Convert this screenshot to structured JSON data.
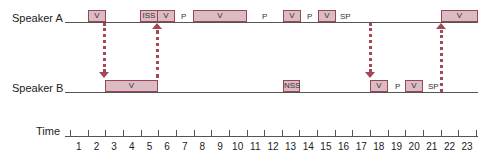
{
  "rows": {
    "speaker_a": "Speaker A",
    "speaker_b": "Speaker B",
    "time": "Time"
  },
  "speaker_a_events": [
    {
      "label": "V",
      "start": 2,
      "end": 3
    },
    {
      "label": "ISS",
      "start": 5,
      "end": 6
    },
    {
      "label": "V",
      "start": 6,
      "end": 7
    },
    {
      "label": "P",
      "at": 7.5
    },
    {
      "label": "V",
      "start": 8,
      "end": 11
    },
    {
      "label": "P",
      "at": 11.5
    },
    {
      "label": "V",
      "start": 12,
      "end": 13
    },
    {
      "label": "P",
      "at": 13.5
    },
    {
      "label": "V",
      "start": 14,
      "end": 15
    },
    {
      "label": "SP",
      "at": 15.6
    },
    {
      "label": "V",
      "start": 21,
      "end": 23
    }
  ],
  "speaker_b_events": [
    {
      "label": "V",
      "start": 2,
      "end": 5
    },
    {
      "label": "NSS",
      "start": 12,
      "end": 13
    },
    {
      "label": "V",
      "start": 17,
      "end": 18
    },
    {
      "label": "P",
      "at": 18.5
    },
    {
      "label": "V",
      "start": 19,
      "end": 20
    },
    {
      "label": "SP",
      "at": 20.6
    }
  ],
  "turn_arrows": [
    {
      "direction": "down",
      "at": 2,
      "from": "Speaker A",
      "to": "Speaker B"
    },
    {
      "direction": "up",
      "at": 5,
      "from": "Speaker B",
      "to": "Speaker A"
    },
    {
      "direction": "down",
      "at": 17,
      "from": "Speaker A",
      "to": "Speaker B"
    },
    {
      "direction": "up",
      "at": 21,
      "from": "Speaker B",
      "to": "Speaker A"
    }
  ],
  "time_axis": {
    "labels": [
      "1",
      "2",
      "3",
      "4",
      "5",
      "6",
      "7",
      "8",
      "9",
      "10",
      "11",
      "12",
      "13",
      "14",
      "15",
      "16",
      "17",
      "18",
      "19",
      "20",
      "21",
      "22",
      "23"
    ]
  },
  "colors": {
    "box_fill": "#dcbcc3",
    "box_border": "#9a4656",
    "arrow": "#a24857",
    "line": "#555555"
  }
}
